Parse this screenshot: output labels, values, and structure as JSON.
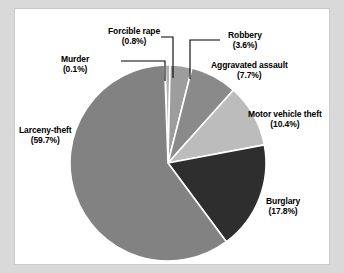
{
  "chart_data": {
    "type": "pie",
    "title": "",
    "subtitle": "",
    "xlabel": "",
    "ylabel": "",
    "legend_position": "none",
    "grid": false,
    "units": "percent",
    "categories": [
      "Murder",
      "Forcible rape",
      "Robbery",
      "Aggravated assault",
      "Motor vehicle theft",
      "Burglary",
      "Larceny-theft"
    ],
    "values": [
      0.1,
      0.8,
      3.6,
      7.7,
      10.4,
      17.8,
      59.7
    ],
    "slices": [
      {
        "label": "Murder",
        "percent": 0.1,
        "percent_text": "(0.1%)",
        "color": "#9a9a9a",
        "start_angle": 0.0,
        "end_angle": 0.36,
        "leader": true
      },
      {
        "label": "Forcible rape",
        "percent": 0.8,
        "percent_text": "(0.8%)",
        "color": "#b0b0b0",
        "start_angle": 0.36,
        "end_angle": 3.24,
        "leader": true
      },
      {
        "label": "Robbery",
        "percent": 3.6,
        "percent_text": "(3.6%)",
        "color": "#9d9d9d",
        "start_angle": 3.24,
        "end_angle": 16.2,
        "leader": true
      },
      {
        "label": "Aggravated assault",
        "percent": 7.7,
        "percent_text": "(7.7%)",
        "color": "#8a8a8a",
        "start_angle": 16.2,
        "end_angle": 43.92,
        "leader": false
      },
      {
        "label": "Motor vehicle theft",
        "percent": 10.4,
        "percent_text": "(10.4%)",
        "color": "#bcbcbc",
        "start_angle": 43.92,
        "end_angle": 81.36,
        "leader": false
      },
      {
        "label": "Burglary",
        "percent": 17.8,
        "percent_text": "(17.8%)",
        "color": "#2e2e2e",
        "start_angle": 81.36,
        "end_angle": 145.44,
        "leader": false
      },
      {
        "label": "Larceny-theft",
        "percent": 59.7,
        "percent_text": "(59.7%)",
        "color": "#828282",
        "start_angle": 145.44,
        "end_angle": 360.0,
        "leader": false
      }
    ]
  },
  "labels": {
    "larceny": {
      "name": "Larceny-theft",
      "percent": "(59.7%)"
    },
    "murder": {
      "name": "Murder",
      "percent": "(0.1%)"
    },
    "rape": {
      "name": "Forcible rape",
      "percent": "(0.8%)"
    },
    "robbery": {
      "name": "Robbery",
      "percent": "(3.6%)"
    },
    "assault": {
      "name": "Aggravated assault",
      "percent": "(7.7%)"
    },
    "motor_vehicle_theft": {
      "name": "Motor vehicle theft",
      "percent": "(10.4%)"
    },
    "burglary": {
      "name": "Burglary",
      "percent": "(17.8%)"
    }
  },
  "style": {
    "page_background": "#d9d9d9",
    "panel_background": "#ffffff",
    "panel_border": "#c9c9c9",
    "slice_divider": "#ffffff",
    "leader_line": "#000000",
    "text_color": "#000000"
  }
}
